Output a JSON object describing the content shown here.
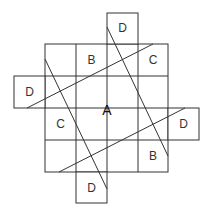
{
  "diagram": {
    "title": "",
    "stroke_color": "#333333",
    "center_label": "A",
    "grid": {
      "cols": 4,
      "rows": 4,
      "x_lines": [
        45,
        76,
        107,
        138,
        168
      ],
      "y_lines": [
        44,
        76,
        108,
        140,
        172
      ]
    },
    "cell_labels": [
      {
        "text": "B",
        "row": 0,
        "col": 1
      },
      {
        "text": "C",
        "row": 0,
        "col": 3
      },
      {
        "text": "C",
        "row": 2,
        "col": 0
      },
      {
        "text": "B",
        "row": 3,
        "col": 3
      }
    ],
    "outer_boxes": [
      {
        "text": "D",
        "position": "top"
      },
      {
        "text": "D",
        "position": "left"
      },
      {
        "text": "D",
        "position": "right"
      },
      {
        "text": "D",
        "position": "bottom"
      }
    ],
    "diagonal_lines": 4
  }
}
